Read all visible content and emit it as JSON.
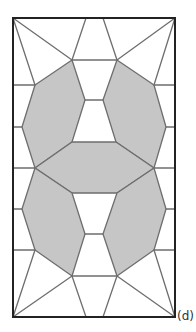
{
  "figure": {
    "label": "(d)",
    "colors": {
      "shaded_fill": "#c6c6c6",
      "line": "#6e6e6e",
      "border": "#222222",
      "background": "#ffffff"
    }
  }
}
